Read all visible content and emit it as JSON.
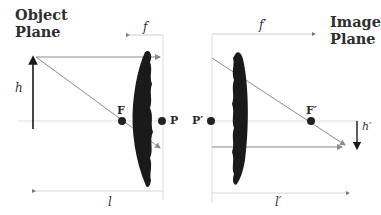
{
  "diagram": {
    "title_left": {
      "line1": "Object",
      "line2": "Plane"
    },
    "title_right": {
      "line1": "Image",
      "line2": "Plane"
    },
    "labels": {
      "focal_length_left": "f",
      "focal_length_right": "f′",
      "object_height": "h",
      "image_height": "h′",
      "object_distance": "l",
      "image_distance": "l′",
      "front_focal_point": "F",
      "rear_focal_point": "F′",
      "front_principal_point": "P",
      "rear_principal_point": "P′"
    },
    "colors": {
      "lens": "#1a1a1a",
      "ray": "#8a8a8a",
      "guide": "#d8d8d8",
      "text": "#2e2e2e"
    }
  }
}
